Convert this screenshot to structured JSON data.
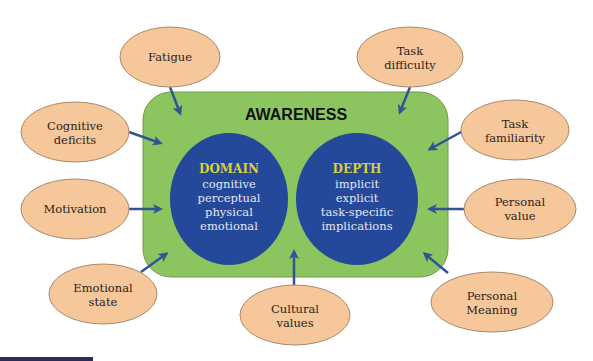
{
  "colors": {
    "awareness_fill": "#8cc55f",
    "awareness_stroke": "#6f9a4c",
    "circle_fill": "#24499a",
    "circle_title": "#d8cf3a",
    "factor_fill": "#f5c79b",
    "factor_stroke": "#a98a6e",
    "arrow": "#2f5597"
  },
  "awareness": {
    "title": "AWARENESS",
    "domain": {
      "title": "DOMAIN",
      "items": [
        "cognitive",
        "perceptual",
        "physical",
        "emotional"
      ]
    },
    "depth": {
      "title": "DEPTH",
      "items": [
        "implicit",
        "explicit",
        "task-specific",
        "implications"
      ]
    }
  },
  "factors": [
    {
      "id": "fatigue",
      "lines": [
        "Fatigue"
      ]
    },
    {
      "id": "cognitive-deficits",
      "lines": [
        "Cognitive",
        "deficits"
      ]
    },
    {
      "id": "motivation",
      "lines": [
        "Motivation"
      ]
    },
    {
      "id": "emotional-state",
      "lines": [
        "Emotional",
        "state"
      ]
    },
    {
      "id": "cultural-values",
      "lines": [
        "Cultural",
        "values"
      ]
    },
    {
      "id": "personal-meaning",
      "lines": [
        "Personal",
        "Meaning"
      ]
    },
    {
      "id": "personal-value",
      "lines": [
        "Personal",
        "value"
      ]
    },
    {
      "id": "task-familiarity",
      "lines": [
        "Task",
        "familiarity"
      ]
    },
    {
      "id": "task-difficulty",
      "lines": [
        "Task",
        "difficulty"
      ]
    }
  ]
}
